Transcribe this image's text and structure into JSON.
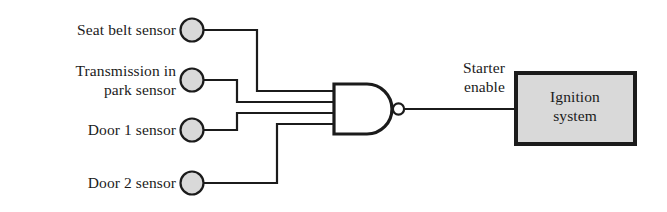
{
  "diagram": {
    "type": "logic-gate-schematic",
    "colors": {
      "line": "#1b1b1b",
      "sensor_fill": "#d9d9d9",
      "box_fill": "#d9d9d9",
      "background": "#ffffff"
    },
    "inputs": [
      {
        "id": "seat-belt",
        "label": "Seat belt sensor",
        "lines": [
          "Seat belt sensor"
        ]
      },
      {
        "id": "transmission-in-park",
        "label": "Transmission in park sensor",
        "lines": [
          "Transmission in",
          "park sensor"
        ]
      },
      {
        "id": "door-1",
        "label": "Door 1 sensor",
        "lines": [
          "Door 1 sensor"
        ]
      },
      {
        "id": "door-2",
        "label": "Door 2 sensor",
        "lines": [
          "Door 2 sensor"
        ]
      }
    ],
    "gate": {
      "type": "NAND",
      "inputs": 4,
      "has_inversion_bubble": true
    },
    "output": {
      "label": "Starter enable",
      "lines": [
        "Starter",
        "enable"
      ]
    },
    "block": {
      "label": "Ignition system",
      "lines": [
        "Ignition",
        "system"
      ]
    }
  }
}
